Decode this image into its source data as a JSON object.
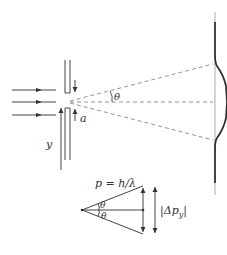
{
  "diagram": {
    "labels": {
      "slit_width": "a",
      "angle": "θ",
      "angle_lower": "θ",
      "axis": "y",
      "momentum": "p = h/λ",
      "momentum_spread": "|Δp",
      "momentum_spread_sub": "y",
      "momentum_spread_close": "|"
    },
    "elements": {
      "incident_rays": 3,
      "slit": "vertical barrier with narrow opening of width a",
      "diffraction_lines": [
        "upper first minimum (dashed)",
        "central axis (dashed)",
        "lower first minimum (dashed)"
      ],
      "screen": "vertical line with intensity profile showing central maximum",
      "momentum_triangle": "vector diagram with half-angle θ above and below axis"
    },
    "colors": {
      "line": "#444444",
      "dashed": "#888888",
      "curve": "#333333"
    }
  }
}
